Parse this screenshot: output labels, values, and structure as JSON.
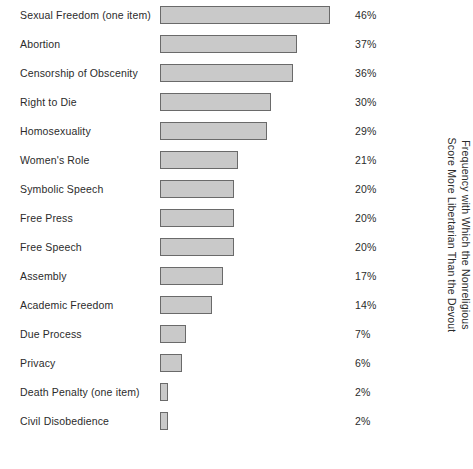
{
  "chart_data": {
    "type": "bar",
    "orientation": "horizontal",
    "title": "",
    "xlabel": "",
    "ylabel": "Frequency with Which the Nonreligious Score More Libertarian Than the Devout",
    "axis_label_lines": [
      "Frequency with Which the Nonreligious",
      "Score More Libertarian Than the Devout"
    ],
    "categories": [
      "Sexual Freedom (one item)",
      "Abortion",
      "Censorship of Obscenity",
      "Right to Die",
      "Homosexuality",
      "Women's Role",
      "Symbolic Speech",
      "Free Press",
      "Free Speech",
      "Assembly",
      "Academic Freedom",
      "Due Process",
      "Privacy",
      "Death Penalty (one item)",
      "Civil Disobedience"
    ],
    "values": [
      46,
      37,
      36,
      30,
      29,
      21,
      20,
      20,
      20,
      17,
      14,
      7,
      6,
      2,
      2
    ],
    "value_labels": [
      "46%",
      "37%",
      "36%",
      "30%",
      "29%",
      "21%",
      "20%",
      "20%",
      "20%",
      "17%",
      "14%",
      "7%",
      "6%",
      "2%",
      "2%"
    ],
    "xlim": [
      0,
      48
    ],
    "grid": false,
    "legend": null,
    "bar_fill_color": "#c9c9c9",
    "bar_border_color": "#6a6a6a",
    "text_color": "#2b2b2b",
    "background_color": "#ffffff",
    "px_per_percent": 3.7
  },
  "rows": [
    {
      "label": "Sexual Freedom (one item)",
      "value": 46,
      "value_label": "46%"
    },
    {
      "label": "Abortion",
      "value": 37,
      "value_label": "37%"
    },
    {
      "label": "Censorship of Obscenity",
      "value": 36,
      "value_label": "36%"
    },
    {
      "label": "Right to Die",
      "value": 30,
      "value_label": "30%"
    },
    {
      "label": "Homosexuality",
      "value": 29,
      "value_label": "29%"
    },
    {
      "label": "Women's Role",
      "value": 21,
      "value_label": "21%"
    },
    {
      "label": "Symbolic Speech",
      "value": 20,
      "value_label": "20%"
    },
    {
      "label": "Free Press",
      "value": 20,
      "value_label": "20%"
    },
    {
      "label": "Free Speech",
      "value": 20,
      "value_label": "20%"
    },
    {
      "label": "Assembly",
      "value": 17,
      "value_label": "17%"
    },
    {
      "label": "Academic Freedom",
      "value": 14,
      "value_label": "14%"
    },
    {
      "label": "Due Process",
      "value": 7,
      "value_label": "7%"
    },
    {
      "label": "Privacy",
      "value": 6,
      "value_label": "6%"
    },
    {
      "label": "Death Penalty (one item)",
      "value": 2,
      "value_label": "2%"
    },
    {
      "label": "Civil Disobedience",
      "value": 2,
      "value_label": "2%"
    }
  ],
  "axis": {
    "line1": "Frequency with Which the Nonreligious",
    "line2": "Score More Libertarian Than the Devout"
  }
}
